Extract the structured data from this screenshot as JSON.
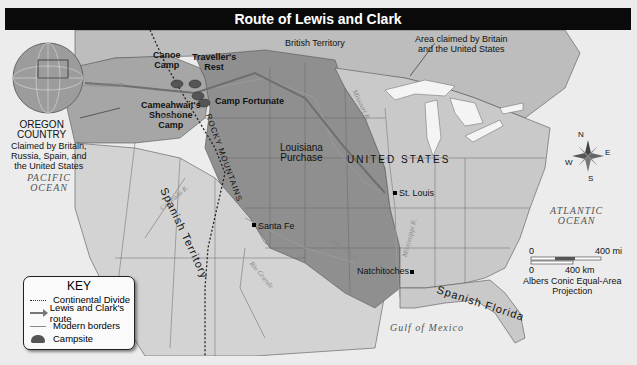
{
  "title": "Route of Lewis and Clark",
  "regions": {
    "british_territory": "British Territory",
    "area_claimed": "Area claimed by Britain\nand the United States",
    "oregon_country": "OREGON\nCOUNTRY",
    "oregon_claim": "Claimed by Britain,\nRussia, Spain, and\nthe United States",
    "louisiana_purchase": "Louisiana\nPurchase",
    "united_states": "UNITED STATES",
    "spanish_territory": "Spanish Territory",
    "spanish_florida": "Spanish Florida",
    "rocky_mountains": "ROCKY MOUNTAINS"
  },
  "water": {
    "pacific": "PACIFIC\nOCEAN",
    "atlantic": "ATLANTIC\nOCEAN",
    "gulf": "Gulf of Mexico",
    "columbia": "Columbia R.",
    "snake": "Snake R.",
    "missouri": "Missouri R.",
    "colorado": "Colorado R.",
    "arkansas": "Arkansas R.",
    "mississippi": "Mississippi R.",
    "rio_grande": "Rio Grande"
  },
  "places": {
    "canoe_camp": "Canoe\nCamp",
    "travellers_rest": "Traveller's\nRest",
    "camp_fortunate": "Camp Fortunate",
    "cameahwait": "Cameahwait's\nShoshone\nCamp",
    "st_louis": "St. Louis",
    "santa_fe": "Santa Fe",
    "natchitoches": "Natchitoches"
  },
  "compass": {
    "n": "N",
    "s": "S",
    "e": "E",
    "w": "W"
  },
  "scale": {
    "mi_zero": "0",
    "mi_max": "400 mi",
    "km_zero": "0",
    "km_max": "400 km",
    "projection": "Albers Conic Equal-Area\nProjection"
  },
  "key": {
    "title": "KEY",
    "items": [
      {
        "label": "Continental Divide",
        "symbol": "dotted-line"
      },
      {
        "label": "Lewis and Clark's route",
        "symbol": "arrow"
      },
      {
        "label": "Modern borders",
        "symbol": "line"
      },
      {
        "label": "Campsite",
        "symbol": "campsite"
      }
    ]
  },
  "colors": {
    "title_bar": "#0a0a0a",
    "ocean": "#ececec",
    "us_land": "#c9c9c9",
    "louisiana": "#8f8f8f",
    "oregon": "#a6a6a6",
    "spanish": "#d3d3d3",
    "british": "#bdbdbd",
    "lakes": "#f4f4f4"
  }
}
